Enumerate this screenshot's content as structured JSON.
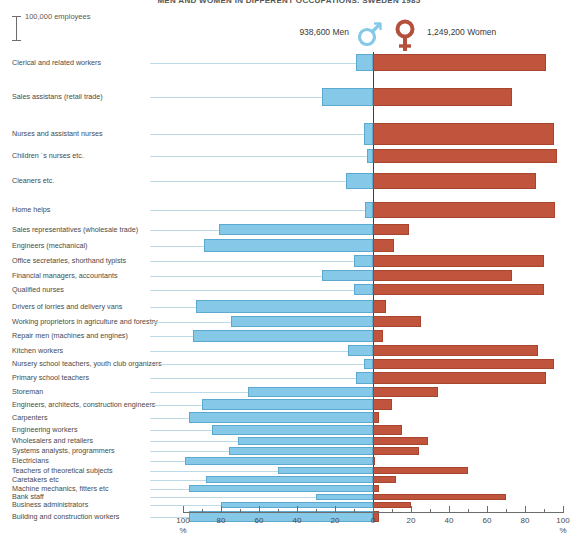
{
  "title": "MEN AND WOMEN IN DIFFERENT OCCUPATIONS. SWEDEN 1985",
  "scale_key": {
    "label": "100,000 employees"
  },
  "legend": {
    "men_label": "938,600 Men",
    "women_label": "1,249,200 Women",
    "male_icon": "mars-symbol-icon",
    "female_icon": "venus-symbol-icon"
  },
  "colors": {
    "men": "#86c8e8",
    "women": "#c0543c",
    "leader": "#b9d8e6",
    "axis": "#6d6d6d"
  },
  "axis": {
    "left_ticks": [
      "100",
      "80",
      "60",
      "40",
      "20",
      "0"
    ],
    "right_ticks": [
      "0",
      "20",
      "40",
      "60",
      "80",
      "100"
    ],
    "unit_left": "%",
    "unit_right": "%",
    "min": 0,
    "max": 100
  },
  "chart_data": {
    "type": "bar",
    "title": "MEN AND WOMEN IN DIFFERENT OCCUPATIONS. SWEDEN 1985",
    "subtype": "diverging-population-pyramid",
    "xlabel": "%",
    "ylabel": "",
    "xlim": [
      -100,
      100
    ],
    "grid": false,
    "legend_position": "top",
    "series": [
      {
        "name": "938,600 Men",
        "color": "#86c8e8",
        "side": "left"
      },
      {
        "name": "1,249,200 Women",
        "color": "#c0543c",
        "side": "right"
      }
    ],
    "note": "bar thickness encodes number of employees (scale key = 100,000 employees); bar length encodes percentage share of that gender in the occupation",
    "categories": [
      "Clerical and related workers",
      "Sales assistans (retail trade)",
      "Nurses and assistant nurses",
      "Children ´s nurses etc.",
      "Cleaners etc.",
      "Home helps",
      "Sales representatives (wholesale trade)",
      "Engineers (mechanical)",
      "Office secretaries, shorthand typists",
      "Financial managers, accountants",
      "Qualified nurses",
      "Drivers of lorries and delivery vans",
      "Working proprietors in agriculture and forestry",
      "Repair men (machines and engines)",
      "Kitchen workers",
      "Nursery school teachers, youth club organizers",
      "Primary school teachers",
      "Storeman",
      "Engineers, architects, construction engineers",
      "Carpenters",
      "Engineering workers",
      "Wholesalers and retailers",
      "Systems analysts, programmers",
      "Electricians",
      "Teachers of theoretical subjects",
      "Caretakers etc",
      "Machine mechanics, fitters etc",
      "Bank staff",
      "Business administrators",
      "Building and construction workers"
    ],
    "men_pct": [
      9,
      27,
      5,
      3,
      14,
      4,
      81,
      89,
      10,
      27,
      10,
      93,
      75,
      95,
      13,
      5,
      9,
      66,
      90,
      97,
      85,
      71,
      76,
      99,
      50,
      88,
      97,
      30,
      80,
      97
    ],
    "women_pct": [
      91,
      73,
      95,
      97,
      86,
      96,
      19,
      11,
      90,
      73,
      90,
      7,
      25,
      5,
      87,
      95,
      91,
      34,
      10,
      3,
      15,
      29,
      24,
      1,
      50,
      12,
      3,
      70,
      20,
      3
    ],
    "employees_rel": [
      12,
      9,
      14,
      7,
      8,
      8,
      6,
      5,
      5,
      5,
      5,
      6,
      5,
      5,
      6,
      5,
      6,
      5,
      5,
      5,
      4,
      4,
      4,
      4,
      3,
      3,
      3,
      3,
      3,
      5
    ]
  },
  "rows": [
    {
      "label": "Clerical and related workers",
      "men": 9,
      "women": 91,
      "top": 2,
      "h": 17
    },
    {
      "label": "Sales assistans (retail trade)",
      "men": 27,
      "women": 73,
      "top": 36,
      "h": 18
    },
    {
      "label": "Nurses and assistant nurses",
      "men": 5,
      "women": 95,
      "top": 71,
      "h": 22
    },
    {
      "label": "Children ´s nurses etc.",
      "men": 3,
      "women": 97,
      "top": 97,
      "h": 14
    },
    {
      "label": "Cleaners etc.",
      "men": 14,
      "women": 86,
      "top": 121,
      "h": 16
    },
    {
      "label": "Home helps",
      "men": 4,
      "women": 96,
      "top": 150,
      "h": 16
    },
    {
      "label": "Sales representatives (wholesale trade)",
      "men": 81,
      "women": 19,
      "top": 172,
      "h": 11
    },
    {
      "label": "Engineers (mechanical)",
      "men": 89,
      "women": 11,
      "top": 187,
      "h": 13
    },
    {
      "label": "Office secretaries, shorthand typists",
      "men": 10,
      "women": 90,
      "top": 203,
      "h": 12
    },
    {
      "label": "Financial managers, accountants",
      "men": 27,
      "women": 73,
      "top": 218,
      "h": 11
    },
    {
      "label": "Qualified nurses",
      "men": 10,
      "women": 90,
      "top": 232,
      "h": 11
    },
    {
      "label": "Drivers of lorries and delivery vans",
      "men": 93,
      "women": 7,
      "top": 248,
      "h": 13
    },
    {
      "label": "Working proprietors in agriculture and forestry",
      "men": 75,
      "women": 25,
      "top": 264,
      "h": 11
    },
    {
      "label": "Repair men (machines and engines)",
      "men": 95,
      "women": 5,
      "top": 278,
      "h": 12
    },
    {
      "label": "Kitchen workers",
      "men": 13,
      "women": 87,
      "top": 293,
      "h": 11
    },
    {
      "label": "Nursery school teachers, youth club organizers",
      "men": 5,
      "women": 95,
      "top": 307,
      "h": 10
    },
    {
      "label": "Primary school teachers",
      "men": 9,
      "women": 91,
      "top": 320,
      "h": 12
    },
    {
      "label": "Storeman",
      "men": 66,
      "women": 34,
      "top": 335,
      "h": 10
    },
    {
      "label": "Engineers, architects, construction engineers",
      "men": 90,
      "women": 10,
      "top": 347,
      "h": 11
    },
    {
      "label": "Carpenters",
      "men": 97,
      "women": 3,
      "top": 360,
      "h": 11
    },
    {
      "label": "Engineering workers",
      "men": 85,
      "women": 15,
      "top": 373,
      "h": 10
    },
    {
      "label": "Wholesalers and retailers",
      "men": 71,
      "women": 29,
      "top": 385,
      "h": 8
    },
    {
      "label": "Systems analysts, programmers",
      "men": 76,
      "women": 24,
      "top": 395,
      "h": 8
    },
    {
      "label": "Electricians",
      "men": 99,
      "women": 1,
      "top": 405,
      "h": 8
    },
    {
      "label": "Teachers of theoretical subjects",
      "men": 50,
      "women": 50,
      "top": 415,
      "h": 7
    },
    {
      "label": "Caretakers etc",
      "men": 88,
      "women": 12,
      "top": 424,
      "h": 7
    },
    {
      "label": "Machine mechanics, fitters etc",
      "men": 97,
      "women": 3,
      "top": 433,
      "h": 7
    },
    {
      "label": "Bank staff",
      "men": 30,
      "women": 70,
      "top": 442,
      "h": 6
    },
    {
      "label": "Business administrators",
      "men": 80,
      "women": 20,
      "top": 450,
      "h": 6
    },
    {
      "label": "Building and construction workers",
      "men": 97,
      "women": 3,
      "top": 459,
      "h": 11
    }
  ]
}
